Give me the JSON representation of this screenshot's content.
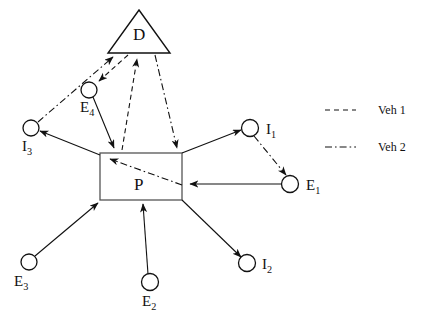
{
  "figure": {
    "type": "diagram",
    "title": "",
    "background_color": "#ffffff",
    "stroke_color": "#111111"
  },
  "nodes": [
    {
      "id": "D",
      "kind": "triangle",
      "label": "D",
      "label_sub": "",
      "cx": 139,
      "cy": 36,
      "label_x": 133,
      "label_y": 26
    },
    {
      "id": "P",
      "kind": "rectangle",
      "label": "P",
      "label_sub": "",
      "cx": 141,
      "cy": 177,
      "label_x": 134,
      "label_y": 176
    },
    {
      "id": "E4",
      "kind": "circle",
      "label": "E",
      "label_sub": "4",
      "cx": 89,
      "cy": 90,
      "label_x": 80,
      "label_y": 100
    },
    {
      "id": "I3",
      "kind": "circle",
      "label": "I",
      "label_sub": "3",
      "cx": 31,
      "cy": 128,
      "label_x": 22,
      "label_y": 139
    },
    {
      "id": "I1",
      "kind": "circle",
      "label": "I",
      "label_sub": "1",
      "cx": 250,
      "cy": 128,
      "label_x": 266,
      "label_y": 122
    },
    {
      "id": "E1",
      "kind": "circle",
      "label": "E",
      "label_sub": "1",
      "cx": 290,
      "cy": 184,
      "label_x": 306,
      "label_y": 178
    },
    {
      "id": "E3",
      "kind": "circle",
      "label": "E",
      "label_sub": "3",
      "cx": 29,
      "cy": 262,
      "label_x": 14,
      "label_y": 274
    },
    {
      "id": "E2",
      "kind": "circle",
      "label": "E",
      "label_sub": "2",
      "cx": 150,
      "cy": 282,
      "label_x": 142,
      "label_y": 294
    },
    {
      "id": "I2",
      "kind": "circle",
      "label": "I",
      "label_sub": "2",
      "cx": 247,
      "cy": 263,
      "label_x": 262,
      "label_y": 257
    }
  ],
  "edges": [
    {
      "id": "e1",
      "from": "I3",
      "to": "D",
      "style": "dashdot",
      "arrow": "end"
    },
    {
      "id": "e2",
      "from": "D",
      "to": "E4",
      "style": "dashed",
      "arrow": "end"
    },
    {
      "id": "e3",
      "from": "E4",
      "to": "P",
      "style": "solid",
      "arrow": "end"
    },
    {
      "id": "e4",
      "from": "P",
      "to": "D",
      "style": "dashed",
      "arrow": "end"
    },
    {
      "id": "e5",
      "from": "D",
      "to": "P",
      "style": "dashdot",
      "arrow": "end"
    },
    {
      "id": "e6",
      "from": "P",
      "to": "I3",
      "style": "solid",
      "arrow": "end"
    },
    {
      "id": "e7",
      "from": "P",
      "to": "I1",
      "style": "solid",
      "arrow": "end"
    },
    {
      "id": "e8",
      "from": "I1",
      "to": "E1",
      "style": "dashdot",
      "arrow": "end"
    },
    {
      "id": "e9",
      "from": "E1",
      "to": "P",
      "style": "solid",
      "arrow": "end"
    },
    {
      "id": "e10",
      "from": "E1",
      "to": "P",
      "style": "dashdot",
      "arrow": "end"
    },
    {
      "id": "e11",
      "from": "E3",
      "to": "P",
      "style": "solid",
      "arrow": "end"
    },
    {
      "id": "e12",
      "from": "E2",
      "to": "P",
      "style": "solid",
      "arrow": "end"
    },
    {
      "id": "e13",
      "from": "P",
      "to": "I2",
      "style": "solid",
      "arrow": "end"
    }
  ],
  "legend": {
    "position": "right",
    "items": [
      {
        "id": "veh1",
        "label": "Veh 1",
        "style": "dashed",
        "sample_x1": 325,
        "sample_x2": 356,
        "sample_y": 110,
        "text_x": 378,
        "text_y": 104
      },
      {
        "id": "veh2",
        "label": "Veh 2",
        "style": "dashdot",
        "sample_x1": 325,
        "sample_x2": 356,
        "sample_y": 147,
        "text_x": 378,
        "text_y": 141
      }
    ]
  }
}
